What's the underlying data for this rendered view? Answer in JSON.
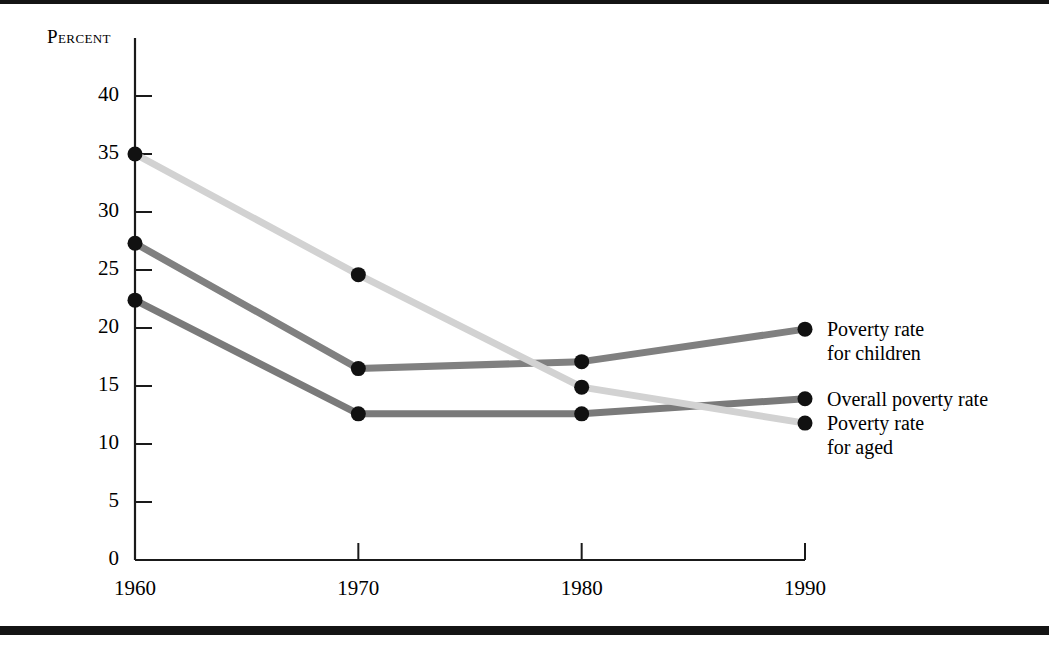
{
  "figure": {
    "background_color": "#ffffff",
    "rule_color": "#141414",
    "axis_color": "#1a1a1a",
    "marker_color": "#111111"
  },
  "chart_data": {
    "type": "line",
    "title": "",
    "subtitle": "",
    "xlabel": "",
    "ylabel": "Percent",
    "x": [
      1960,
      1970,
      1980,
      1990
    ],
    "categories": [
      "1960",
      "1970",
      "1980",
      "1990"
    ],
    "xlim": [
      1960,
      1990
    ],
    "ylim": [
      0,
      40
    ],
    "yticks": [
      0,
      5,
      10,
      15,
      20,
      25,
      30,
      35,
      40
    ],
    "ytick_labels": [
      "0",
      "5",
      "10",
      "15",
      "20",
      "25",
      "30",
      "35",
      "40"
    ],
    "xticks": [
      1960,
      1970,
      1980,
      1990
    ],
    "xtick_labels": [
      "1960",
      "1970",
      "1980",
      "1990"
    ],
    "grid": false,
    "legend_position": "right-inline-labels",
    "series": [
      {
        "name": "Poverty rate for children",
        "label_lines": [
          "Poverty rate",
          "for children"
        ],
        "color": "#808080",
        "values": [
          27.3,
          16.5,
          17.1,
          19.9
        ]
      },
      {
        "name": "Overall poverty rate",
        "label_lines": [
          "Overall poverty rate"
        ],
        "color": "#7a7a7a",
        "values": [
          22.4,
          12.6,
          12.6,
          13.9
        ]
      },
      {
        "name": "Poverty rate for aged",
        "label_lines": [
          "Poverty rate",
          "for aged"
        ],
        "color": "#d2d2d2",
        "values": [
          35.0,
          24.6,
          14.9,
          11.8
        ]
      }
    ]
  }
}
